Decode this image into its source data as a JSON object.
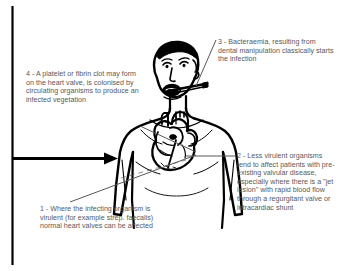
{
  "diagram": {
    "colors": {
      "background": "#ffffff",
      "ink": "#000000",
      "text": "#58585a"
    },
    "frame": {
      "left_border_label": "left-vertical-rule"
    },
    "arrow": {
      "label": "flow-arrow",
      "direction": "right"
    },
    "notes": [
      {
        "id": "note-1",
        "number": "1",
        "text": "1 - Where the infecting organism is virulent (for example strep. faecalis) normal heart valves can be affected"
      },
      {
        "id": "note-2",
        "number": "2",
        "text": "2 - Less virulent organisms tend to affect patients with pre-existing valvular disease, especially where there is a \"jet lesion\" with rapid blood flow through a regurgitant valve or intracardiac shunt"
      },
      {
        "id": "note-3",
        "number": "3",
        "text": "3 - Bacteraemia, resulting from dental manipulation classically starts the infection"
      },
      {
        "id": "note-4",
        "number": "4",
        "text": "4 - A platelet or fibrin clot may form on the heart valve, is colonised by circulating organisms to produce an infected vegetation"
      }
    ],
    "figure_parts": {
      "head": "head-outline",
      "face": "face-features",
      "mouth": "open-mouth",
      "instrument": "dental-instrument",
      "torso": "torso-outline",
      "arms": "arms-outline",
      "heart": "anatomical-heart"
    }
  }
}
